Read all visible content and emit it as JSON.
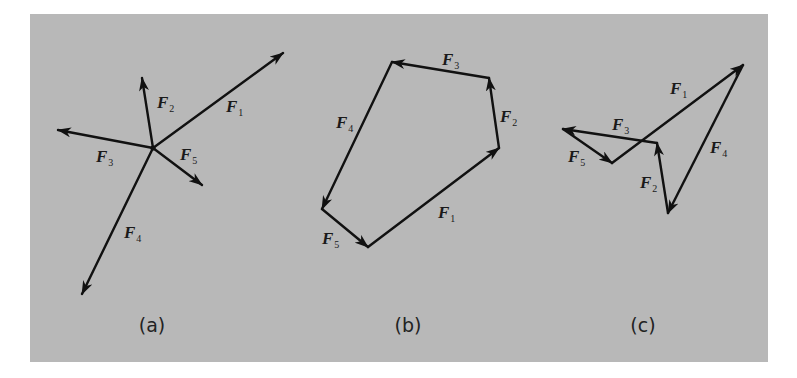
{
  "colors": {
    "background": "#ffffff",
    "panel": "#b8b8b8",
    "ink": "#111111"
  },
  "panel": {
    "x": 30,
    "y": 14,
    "width": 738,
    "height": 348
  },
  "diagrams": [
    {
      "id": "a",
      "caption": "(a)",
      "caption_pos": [
        152,
        332
      ],
      "kind": "concurrent-forces",
      "origin": [
        153,
        148
      ],
      "vectors": [
        {
          "name": "F",
          "sub": "1",
          "from": [
            153,
            148
          ],
          "to": [
            283,
            53
          ],
          "label_pos": [
            226,
            112
          ]
        },
        {
          "name": "F",
          "sub": "2",
          "from": [
            153,
            148
          ],
          "to": [
            142,
            78
          ],
          "label_pos": [
            157,
            108
          ]
        },
        {
          "name": "F",
          "sub": "3",
          "from": [
            153,
            148
          ],
          "to": [
            58,
            130
          ],
          "label_pos": [
            96,
            162
          ]
        },
        {
          "name": "F",
          "sub": "4",
          "from": [
            153,
            148
          ],
          "to": [
            82,
            294
          ],
          "label_pos": [
            124,
            238
          ]
        },
        {
          "name": "F",
          "sub": "5",
          "from": [
            153,
            148
          ],
          "to": [
            202,
            185
          ],
          "label_pos": [
            180,
            160
          ]
        }
      ]
    },
    {
      "id": "b",
      "caption": "(b)",
      "caption_pos": [
        408,
        332
      ],
      "kind": "closed-polygon",
      "vectors": [
        {
          "name": "F",
          "sub": "1",
          "from": [
            368,
            247
          ],
          "to": [
            499,
            148
          ],
          "label_pos": [
            438,
            218
          ]
        },
        {
          "name": "F",
          "sub": "2",
          "from": [
            499,
            148
          ],
          "to": [
            489,
            78
          ],
          "label_pos": [
            500,
            122
          ]
        },
        {
          "name": "F",
          "sub": "3",
          "from": [
            489,
            78
          ],
          "to": [
            392,
            62
          ],
          "label_pos": [
            442,
            65
          ]
        },
        {
          "name": "F",
          "sub": "4",
          "from": [
            392,
            62
          ],
          "to": [
            322,
            209
          ],
          "label_pos": [
            336,
            128
          ]
        },
        {
          "name": "F",
          "sub": "5",
          "from": [
            322,
            209
          ],
          "to": [
            368,
            247
          ],
          "label_pos": [
            322,
            244
          ]
        }
      ]
    },
    {
      "id": "c",
      "caption": "(c)",
      "caption_pos": [
        643,
        332
      ],
      "kind": "closed-polygon-different-order",
      "vectors": [
        {
          "name": "F",
          "sub": "1",
          "from": [
            612,
            163
          ],
          "to": [
            743,
            65
          ],
          "label_pos": [
            670,
            94
          ]
        },
        {
          "name": "F",
          "sub": "4",
          "from": [
            743,
            65
          ],
          "to": [
            668,
            213
          ],
          "label_pos": [
            710,
            153
          ]
        },
        {
          "name": "F",
          "sub": "2",
          "from": [
            668,
            213
          ],
          "to": [
            657,
            143
          ],
          "label_pos": [
            640,
            188
          ]
        },
        {
          "name": "F",
          "sub": "3",
          "from": [
            657,
            143
          ],
          "to": [
            563,
            129
          ],
          "label_pos": [
            612,
            130
          ]
        },
        {
          "name": "F",
          "sub": "5",
          "from": [
            563,
            129
          ],
          "to": [
            612,
            163
          ],
          "label_pos": [
            568,
            162
          ]
        }
      ]
    }
  ]
}
